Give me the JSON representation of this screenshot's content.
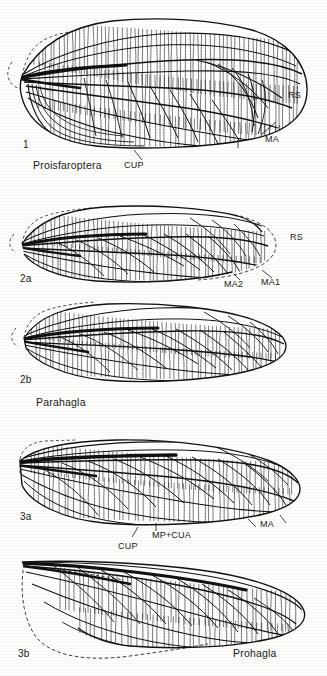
{
  "plate": {
    "title": "Fossil insect forewing venation comparison plate",
    "background_color": "#fdfdfb",
    "ink_color": "#111111",
    "width": 327,
    "height": 676
  },
  "figures": [
    {
      "number": "1",
      "taxon": "Proisfaroptera",
      "num_pos": {
        "x": 23,
        "y": 145
      },
      "taxon_pos": {
        "x": 33,
        "y": 165
      },
      "box": {
        "x": 8,
        "y": 14,
        "w": 300,
        "h": 128
      },
      "style": "dense-reticulate",
      "vein_labels": [
        {
          "text": "RS",
          "x": 288,
          "y": 96,
          "leader": false
        },
        {
          "text": "MA",
          "x": 265,
          "y": 140,
          "leader": true
        },
        {
          "text": "CUP",
          "x": 124,
          "y": 166,
          "leader": true
        }
      ]
    },
    {
      "number": "2a",
      "taxon": "",
      "num_pos": {
        "x": 20,
        "y": 277
      },
      "taxon_pos": null,
      "box": {
        "x": 14,
        "y": 198,
        "w": 268,
        "h": 86
      },
      "style": "oblique-lattice",
      "vein_labels": [
        {
          "text": "RS",
          "x": 290,
          "y": 236,
          "leader": false
        },
        {
          "text": "MA2",
          "x": 228,
          "y": 283,
          "leader": true
        },
        {
          "text": "MA1",
          "x": 262,
          "y": 281,
          "leader": true
        }
      ]
    },
    {
      "number": "2b",
      "taxon": "Parahagla",
      "num_pos": {
        "x": 20,
        "y": 378
      },
      "taxon_pos": {
        "x": 36,
        "y": 402
      },
      "box": {
        "x": 16,
        "y": 300,
        "w": 272,
        "h": 80
      },
      "style": "oblique-lattice",
      "vein_labels": []
    },
    {
      "number": "3a",
      "taxon": "",
      "num_pos": {
        "x": 20,
        "y": 515
      },
      "taxon_pos": null,
      "box": {
        "x": 14,
        "y": 437,
        "w": 286,
        "h": 82
      },
      "style": "coarse-reticulate",
      "vein_labels": [
        {
          "text": "MA",
          "x": 260,
          "y": 524,
          "leader": true
        },
        {
          "text": "MP+CUA",
          "x": 152,
          "y": 535,
          "leader": false
        },
        {
          "text": "CUP",
          "x": 118,
          "y": 546,
          "leader": true
        }
      ]
    },
    {
      "number": "3b",
      "taxon": "Prohagla",
      "num_pos": {
        "x": 18,
        "y": 652
      },
      "taxon_pos": {
        "x": 233,
        "y": 652
      },
      "box": {
        "x": 14,
        "y": 556,
        "w": 292,
        "h": 92
      },
      "style": "coarse-reticulate-dashed-base",
      "vein_labels": []
    }
  ],
  "legend_terms": {
    "RS": "radial sector",
    "MA": "media anterior",
    "MA1": "media anterior first branch",
    "MA2": "media anterior second branch",
    "CUP": "cubitus posterior",
    "MP+CUA": "media posterior plus cubitus anterior"
  }
}
